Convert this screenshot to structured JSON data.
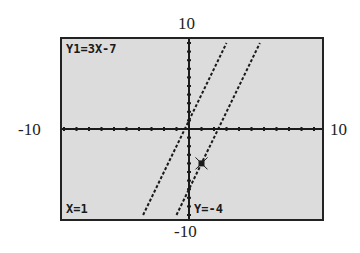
{
  "window": {
    "ymax_label": "10",
    "ymin_label": "-10",
    "xmin_label": "-10",
    "xmax_label": "10"
  },
  "screen": {
    "function_label": "Y1=3X-7",
    "x_readout": "X=1",
    "y_readout": "Y=-4"
  },
  "colors": {
    "screen_bg": "#dcdcdc",
    "ink": "#1a1a1a"
  },
  "chart_data": {
    "type": "line",
    "title": "",
    "xlim": [
      -10,
      10
    ],
    "ylim": [
      -10,
      10
    ],
    "xscl": 1,
    "yscl": 1,
    "series": [
      {
        "name": "Y=3X+1",
        "slope": 3,
        "intercept": 1,
        "points": [
          [
            -3.67,
            -10
          ],
          [
            3,
            10
          ]
        ]
      },
      {
        "name": "Y1=3X-7",
        "slope": 3,
        "intercept": -7,
        "points": [
          [
            -1,
            -10
          ],
          [
            5.67,
            10
          ]
        ]
      }
    ],
    "trace_cursor": {
      "x": 1,
      "y": -4,
      "series": "Y1=3X-7"
    },
    "annotations": [
      "Y1=3X-7",
      "X=1",
      "Y=-4"
    ],
    "tick_labels": {
      "x": [
        "-10",
        "10"
      ],
      "y": [
        "-10",
        "10"
      ]
    },
    "grid": false
  }
}
